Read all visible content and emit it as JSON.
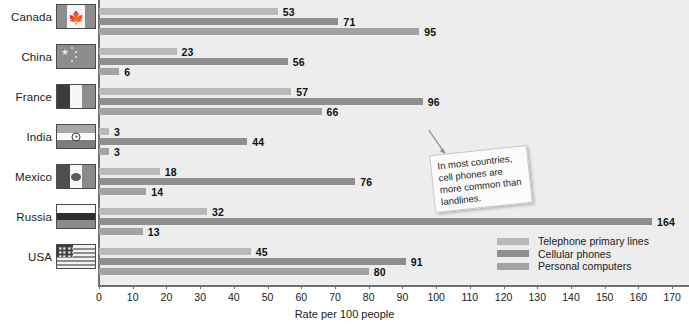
{
  "chart_data": {
    "type": "bar",
    "orientation": "horizontal",
    "title": "",
    "xlabel": "Rate per 100 people",
    "ylabel": "",
    "xlim": [
      0,
      175
    ],
    "xticks": [
      0,
      10,
      20,
      30,
      40,
      50,
      60,
      70,
      80,
      90,
      100,
      110,
      120,
      130,
      140,
      150,
      160,
      170
    ],
    "grid": false,
    "legend_position": "bottom-right",
    "categories": [
      "Canada",
      "China",
      "France",
      "India",
      "Mexico",
      "Russia",
      "USA"
    ],
    "series": [
      {
        "name": "Telephone primary lines",
        "color": "#b9b9b9",
        "values": [
          53,
          23,
          57,
          3,
          18,
          32,
          45
        ]
      },
      {
        "name": "Cellular phones",
        "color": "#8e8e8e",
        "values": [
          71,
          56,
          96,
          44,
          76,
          164,
          91
        ]
      },
      {
        "name": "Personal computers",
        "color": "#a3a3a3",
        "values": [
          95,
          6,
          66,
          3,
          14,
          13,
          80
        ]
      }
    ],
    "annotations": [
      {
        "text": "In most countries, cell phones are more common than landlines."
      }
    ]
  },
  "axis": {
    "x_title": "Rate per 100 people",
    "tick_labels": [
      "0",
      "10",
      "20",
      "30",
      "40",
      "50",
      "60",
      "70",
      "80",
      "90",
      "100",
      "110",
      "120",
      "130",
      "140",
      "150",
      "160",
      "170"
    ]
  },
  "legend": {
    "items": [
      {
        "label": "Telephone primary lines"
      },
      {
        "label": "Cellular phones"
      },
      {
        "label": "Personal computers"
      }
    ]
  },
  "categories": [
    {
      "name": "Canada",
      "flag": "flag-canada"
    },
    {
      "name": "China",
      "flag": "flag-china"
    },
    {
      "name": "France",
      "flag": "flag-france"
    },
    {
      "name": "India",
      "flag": "flag-india"
    },
    {
      "name": "Mexico",
      "flag": "flag-mexico"
    },
    {
      "name": "Russia",
      "flag": "flag-russia"
    },
    {
      "name": "USA",
      "flag": "flag-usa"
    }
  ],
  "callout": {
    "text": "In most countries, cell phones are more common than landlines."
  },
  "values_flat": {
    "canada": [
      "53",
      "71",
      "95"
    ],
    "china": [
      "23",
      "56",
      "6"
    ],
    "france": [
      "57",
      "96",
      "66"
    ],
    "india": [
      "3",
      "44",
      "3"
    ],
    "mexico": [
      "18",
      "76",
      "14"
    ],
    "russia": [
      "32",
      "164",
      "13"
    ],
    "usa": [
      "45",
      "91",
      "80"
    ]
  }
}
